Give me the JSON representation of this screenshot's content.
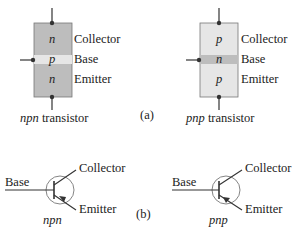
{
  "part_a": {
    "label": "(a)",
    "npn": {
      "caption_italic": "npn",
      "caption_rest": " transistor",
      "layers": [
        "n",
        "p",
        "n"
      ],
      "terminals": [
        "Collector",
        "Base",
        "Emitter"
      ]
    },
    "pnp": {
      "caption_italic": "pnp",
      "caption_rest": " transistor",
      "layers": [
        "p",
        "n",
        "p"
      ],
      "terminals": [
        "Collector",
        "Base",
        "Emitter"
      ]
    }
  },
  "part_b": {
    "label": "(b)",
    "npn": {
      "caption": "npn",
      "base": "Base",
      "collector": "Collector",
      "emitter": "Emitter"
    },
    "pnp": {
      "caption": "pnp",
      "base": "Base",
      "collector": "Collector",
      "emitter": "Emitter"
    }
  },
  "colors": {
    "dark_region": "#bdbdbd",
    "light_region": "#e6e6e6",
    "line": "#333333"
  }
}
